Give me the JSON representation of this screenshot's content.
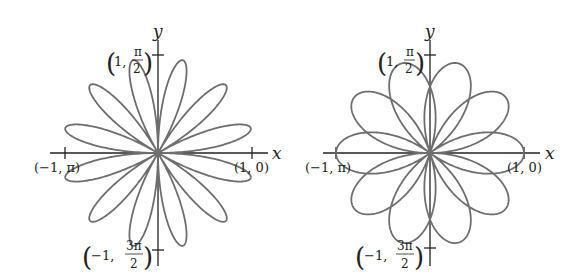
{
  "graphs": [
    {
      "id": "left",
      "center": [
        158,
        153
      ],
      "scale": 96,
      "formula": "r = sin(6θ)",
      "k": 6,
      "phase": "sin",
      "thetaMax": 6.2832,
      "labels": {
        "x_axis": "x",
        "y_axis": "y",
        "right_point": "(1, 0)",
        "left_point": "(−1, π)",
        "top_point_a": "1,",
        "top_point_num": "π",
        "top_point_den": "2",
        "bottom_point_a": "−1,",
        "bottom_point_num": "3π",
        "bottom_point_den": "2"
      }
    },
    {
      "id": "right",
      "center": [
        430,
        153
      ],
      "scale": 94,
      "formula": "r = cos(5θ/2)",
      "k": 2.5,
      "phase": "cos",
      "thetaMax": 12.5664,
      "labels": {
        "x_axis": "x",
        "y_axis": "y",
        "right_point": "(1, 0)",
        "left_point": "(−1, π)",
        "top_point_a": "1,",
        "top_point_num": "π",
        "top_point_den": "2",
        "bottom_point_a": "−1,",
        "bottom_point_num": "3π",
        "bottom_point_den": "2"
      }
    }
  ],
  "colors": {
    "curve": "#6e6e6e",
    "axis": "#222222"
  }
}
